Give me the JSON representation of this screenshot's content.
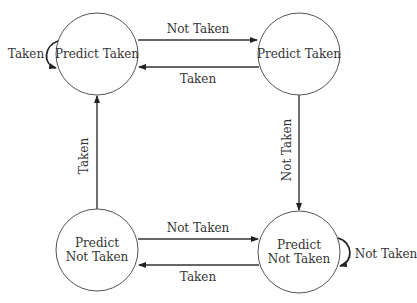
{
  "diagram": {
    "states": [
      {
        "id": "s0",
        "lines": [
          "Predict Taken"
        ],
        "cx": 97,
        "cy": 54,
        "r": 41
      },
      {
        "id": "s1",
        "lines": [
          "Predict Taken"
        ],
        "cx": 299,
        "cy": 54,
        "r": 41
      },
      {
        "id": "s2",
        "lines": [
          "Predict",
          "Not Taken"
        ],
        "cx": 97,
        "cy": 250,
        "r": 41
      },
      {
        "id": "s3",
        "lines": [
          "Predict",
          "Not Taken"
        ],
        "cx": 299,
        "cy": 252,
        "r": 41
      }
    ],
    "edges": [
      {
        "from": "s0",
        "to": "s0",
        "label": "Taken"
      },
      {
        "from": "s0",
        "to": "s1",
        "label": "Not Taken"
      },
      {
        "from": "s1",
        "to": "s0",
        "label": "Taken"
      },
      {
        "from": "s1",
        "to": "s3",
        "label": "Not Taken"
      },
      {
        "from": "s2",
        "to": "s0",
        "label": "Taken"
      },
      {
        "from": "s2",
        "to": "s3",
        "label": "Not Taken"
      },
      {
        "from": "s3",
        "to": "s2",
        "label": "Taken"
      },
      {
        "from": "s3",
        "to": "s3",
        "label": "Not Taken"
      }
    ]
  },
  "colors": {
    "background": "#ffffff",
    "stroke": "#333333",
    "text": "#333333"
  }
}
